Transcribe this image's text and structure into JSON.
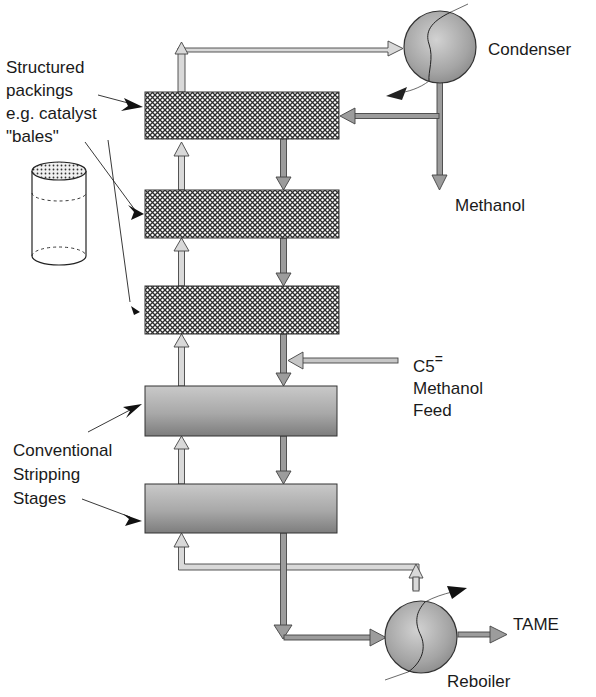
{
  "diagram": {
    "labels": {
      "condenser": "Condenser",
      "methanol_out": "Methanol",
      "structured_packings": [
        "Structured",
        "packings",
        "e.g. catalyst",
        "\"bales\""
      ],
      "feed_species": "C5",
      "feed_superscript": "=",
      "feed_lines": [
        "Methanol",
        "Feed"
      ],
      "conventional_stages": [
        "Conventional",
        "Stripping",
        "Stages"
      ],
      "tame_product": "TAME",
      "reboiler": "Reboiler"
    },
    "components": [
      {
        "id": "condenser",
        "type": "heat-exchanger"
      },
      {
        "id": "catalyst-bed-1",
        "type": "structured-packing"
      },
      {
        "id": "catalyst-bed-2",
        "type": "structured-packing"
      },
      {
        "id": "catalyst-bed-3",
        "type": "structured-packing"
      },
      {
        "id": "stripping-stage-1",
        "type": "conventional-stage"
      },
      {
        "id": "stripping-stage-2",
        "type": "conventional-stage"
      },
      {
        "id": "reboiler",
        "type": "heat-exchanger"
      },
      {
        "id": "catalyst-bale",
        "type": "cylinder-illustration"
      }
    ],
    "colors": {
      "vapor_arrow": "#d4d4d4",
      "liquid_arrow": "#9a9a9a",
      "outline": "#333333",
      "stage_dark": "#8a8a8a",
      "stage_light": "#c8c8c8",
      "sphere": "#b0b0b0"
    }
  }
}
